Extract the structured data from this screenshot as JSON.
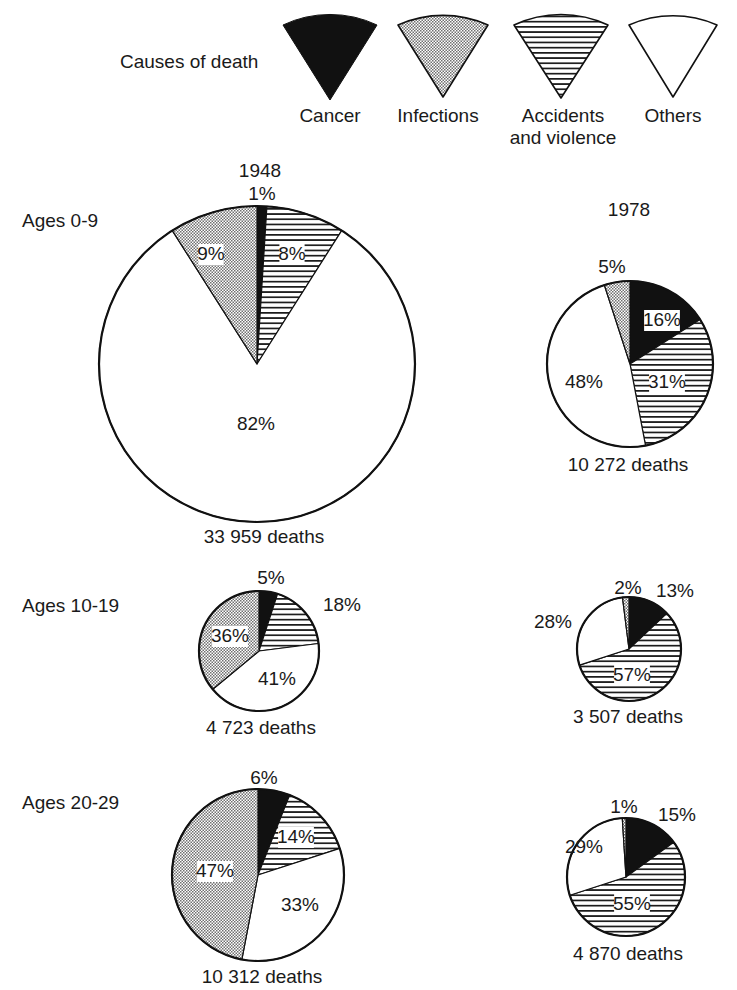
{
  "legend": {
    "title": "Causes of death",
    "items": [
      {
        "key": "cancer",
        "label": [
          "Cancer"
        ],
        "fill": "solid-black"
      },
      {
        "key": "infections",
        "label": [
          "Infections"
        ],
        "fill": "dotted-gray"
      },
      {
        "key": "accidents",
        "label": [
          "Accidents",
          "and violence"
        ],
        "fill": "horizontal-stripes"
      },
      {
        "key": "others",
        "label": [
          "Others"
        ],
        "fill": "white"
      }
    ]
  },
  "years": [
    "1948",
    "1978"
  ],
  "age_groups": [
    "Ages 0-9",
    "Ages 10-19",
    "Ages 20-29"
  ],
  "chart_data": {
    "type": "pie",
    "title": "Causes of death",
    "legend_position": "top",
    "slice_order_clockwise_from_top": [
      "cancer",
      "accidents",
      "others",
      "infections"
    ],
    "pies": [
      {
        "age_group": "Ages 0-9",
        "year": "1948",
        "total_deaths": "33 959 deaths",
        "values": {
          "cancer": 1,
          "infections": 9,
          "accidents": 8,
          "others": 82
        }
      },
      {
        "age_group": "Ages 0-9",
        "year": "1978",
        "total_deaths": "10 272 deaths",
        "values": {
          "cancer": 16,
          "infections": 5,
          "accidents": 31,
          "others": 48
        }
      },
      {
        "age_group": "Ages 10-19",
        "year": "1948",
        "total_deaths": "4 723 deaths",
        "values": {
          "cancer": 5,
          "infections": 36,
          "accidents": 18,
          "others": 41
        }
      },
      {
        "age_group": "Ages 10-19",
        "year": "1978",
        "total_deaths": "3 507 deaths",
        "values": {
          "cancer": 13,
          "infections": 2,
          "accidents": 57,
          "others": 28
        }
      },
      {
        "age_group": "Ages 20-29",
        "year": "1948",
        "total_deaths": "10 312 deaths",
        "values": {
          "cancer": 6,
          "infections": 47,
          "accidents": 14,
          "others": 33
        }
      },
      {
        "age_group": "Ages 20-29",
        "year": "1978",
        "total_deaths": "4 870 deaths",
        "values": {
          "cancer": 15,
          "infections": 1,
          "accidents": 55,
          "others": 29
        }
      }
    ]
  },
  "layout": {
    "pies": [
      {
        "cx": 257,
        "cy": 364,
        "r": 158,
        "labels": {
          "cancer": [
            262,
            200,
            "middle"
          ],
          "infections": [
            211,
            260,
            "middle",
            true
          ],
          "accidents": [
            292,
            260,
            "middle",
            true
          ],
          "others": [
            256,
            430,
            "middle"
          ]
        },
        "deaths": [
          264,
          543
        ]
      },
      {
        "cx": 630,
        "cy": 364,
        "r": 83,
        "labels": {
          "cancer": [
            662,
            326,
            "middle",
            true
          ],
          "infections": [
            612,
            273,
            "middle"
          ],
          "accidents": [
            667,
            388,
            "middle",
            true
          ],
          "others": [
            584,
            388,
            "middle"
          ]
        },
        "deaths": [
          628,
          471
        ]
      },
      {
        "cx": 259,
        "cy": 651,
        "r": 60,
        "labels": {
          "cancer": [
            271,
            584,
            "middle"
          ],
          "infections": [
            230,
            642,
            "middle",
            true
          ],
          "accidents": [
            342,
            611,
            "middle"
          ],
          "others": [
            277,
            685,
            "middle"
          ]
        },
        "deaths": [
          261,
          734
        ]
      },
      {
        "cx": 629,
        "cy": 649,
        "r": 52,
        "labels": {
          "cancer": [
            675,
            597,
            "middle"
          ],
          "infections": [
            628,
            594,
            "middle"
          ],
          "accidents": [
            632,
            681,
            "middle",
            true
          ],
          "others": [
            553,
            628,
            "middle"
          ]
        },
        "deaths": [
          628,
          723
        ]
      },
      {
        "cx": 258,
        "cy": 875,
        "r": 86,
        "labels": {
          "cancer": [
            264,
            784,
            "middle"
          ],
          "infections": [
            215,
            877,
            "middle",
            true
          ],
          "accidents": [
            296,
            843,
            "middle",
            true
          ],
          "others": [
            300,
            911,
            "middle"
          ]
        },
        "deaths": [
          262,
          983
        ]
      },
      {
        "cx": 626,
        "cy": 877,
        "r": 59,
        "labels": {
          "cancer": [
            677,
            821,
            "middle"
          ],
          "infections": [
            624,
            813,
            "middle"
          ],
          "accidents": [
            632,
            910,
            "middle",
            true
          ],
          "others": [
            584,
            853,
            "middle"
          ]
        },
        "deaths": [
          628,
          960
        ]
      }
    ],
    "years": [
      [
        260,
        177
      ],
      [
        629,
        216
      ]
    ],
    "ages": [
      [
        22,
        227
      ],
      [
        22,
        612
      ],
      [
        22,
        809
      ]
    ],
    "legend_title": [
      120,
      68
    ],
    "legend_wedges": [
      {
        "cx": 330,
        "apex": 100,
        "halfw": 47,
        "top": 25,
        "labelx": 330,
        "labely": 122
      },
      {
        "cx": 443,
        "apex": 97,
        "halfw": 45,
        "top": 25,
        "labelx": 438,
        "labely": 122
      },
      {
        "cx": 561,
        "apex": 98,
        "halfw": 47,
        "top": 25,
        "labelx": 563,
        "labely": 122
      },
      {
        "cx": 673,
        "apex": 97,
        "halfw": 44,
        "top": 25,
        "labelx": 673,
        "labely": 122
      }
    ]
  }
}
